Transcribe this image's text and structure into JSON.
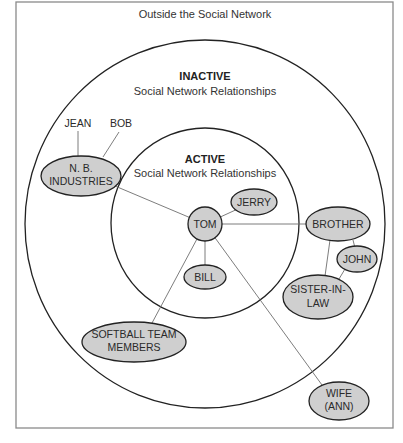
{
  "diagram": {
    "type": "social-network-concentric",
    "colors": {
      "node_fill": "#cfcfcf",
      "node_stroke": "#222222",
      "edge": "#6e6e6e",
      "frame": "#8a8a8a",
      "text": "#2a2a2a"
    },
    "outside": {
      "title": "Outside the Social Network"
    },
    "zones": {
      "inactive": {
        "title": "INACTIVE",
        "subtitle": "Social Network Relationships"
      },
      "active": {
        "title": "ACTIVE",
        "subtitle": "Social Network Relationships"
      }
    },
    "nodes": {
      "tom": {
        "lines": [
          "TOM"
        ]
      },
      "jerry": {
        "lines": [
          "JERRY"
        ]
      },
      "bill": {
        "lines": [
          "BILL"
        ]
      },
      "nb_industries": {
        "lines": [
          "N. B.",
          "INDUSTRIES"
        ]
      },
      "brother": {
        "lines": [
          "BROTHER"
        ]
      },
      "john": {
        "lines": [
          "JOHN"
        ]
      },
      "sister_in_law": {
        "lines": [
          "SISTER-IN-",
          "LAW"
        ]
      },
      "softball": {
        "lines": [
          "SOFTBALL TEAM",
          "MEMBERS"
        ]
      },
      "wife": {
        "lines": [
          "WIFE",
          "(ANN)"
        ]
      }
    },
    "labels": {
      "jean": "JEAN",
      "bob": "BOB"
    },
    "edges": [
      [
        "TOM",
        "JERRY"
      ],
      [
        "TOM",
        "BILL"
      ],
      [
        "TOM",
        "N. B. INDUSTRIES"
      ],
      [
        "TOM",
        "BROTHER"
      ],
      [
        "TOM",
        "SOFTBALL TEAM MEMBERS"
      ],
      [
        "TOM",
        "WIFE (ANN)"
      ],
      [
        "N. B. INDUSTRIES",
        "JEAN"
      ],
      [
        "N. B. INDUSTRIES",
        "BOB"
      ],
      [
        "BROTHER",
        "JOHN"
      ],
      [
        "BROTHER",
        "SISTER-IN-LAW"
      ],
      [
        "JOHN",
        "SISTER-IN-LAW"
      ]
    ]
  }
}
